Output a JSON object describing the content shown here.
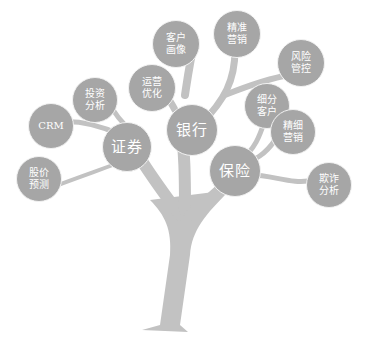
{
  "diagram": {
    "type": "tree",
    "colors": {
      "trunk": "#c2c2c2",
      "node": "#a6a6a6",
      "text": "#ffffff"
    },
    "main_nodes": [
      {
        "id": "securities",
        "label": "证券"
      },
      {
        "id": "bank",
        "label": "银行"
      },
      {
        "id": "insurance",
        "label": "保险"
      }
    ],
    "leaf_nodes": [
      {
        "id": "stock-prediction",
        "label": "股价\n预测",
        "parent": "securities"
      },
      {
        "id": "crm",
        "label": "CRM",
        "parent": "securities"
      },
      {
        "id": "investment-analysis",
        "label": "投资\n分析",
        "parent": "securities"
      },
      {
        "id": "operations-optimization",
        "label": "运营\n优化",
        "parent": "bank"
      },
      {
        "id": "customer-profile",
        "label": "客户\n画像",
        "parent": "bank"
      },
      {
        "id": "precision-marketing",
        "label": "精准\n营销",
        "parent": "bank"
      },
      {
        "id": "risk-control",
        "label": "风险\n管控",
        "parent": "bank"
      },
      {
        "id": "customer-segmentation",
        "label": "细分\n客户",
        "parent": "insurance"
      },
      {
        "id": "fine-marketing",
        "label": "精细\n营销",
        "parent": "insurance"
      },
      {
        "id": "fraud-analysis",
        "label": "欺诈\n分析",
        "parent": "insurance"
      }
    ]
  }
}
